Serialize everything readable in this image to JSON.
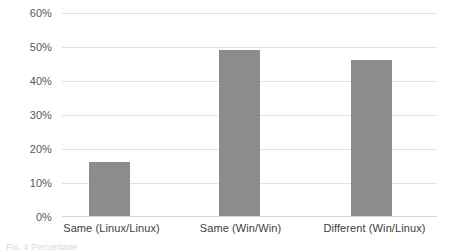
{
  "chart_data": {
    "type": "bar",
    "title": "",
    "subtitle": "",
    "xlabel": "",
    "ylabel": "",
    "categories": [
      "Same (Linux/Linux)",
      "Same (Win/Win)",
      "Different (Win/Linux)"
    ],
    "values": [
      16,
      49,
      46
    ],
    "value_labels": [
      "16%",
      "49%",
      "46%"
    ],
    "ylim": [
      0,
      60
    ],
    "ytick_values": [
      0,
      10,
      20,
      30,
      40,
      50,
      60
    ],
    "ytick_labels": [
      "0%",
      "10%",
      "20%",
      "30%",
      "40%",
      "50%",
      "60%"
    ],
    "grid": true,
    "legend": false,
    "legend_position": "none",
    "series": [
      {
        "name": "",
        "color": "#8c8c8c",
        "values": [
          16,
          49,
          46
        ]
      }
    ]
  },
  "style": {
    "bar_color": "#8c8c8c",
    "gridline_color": "#e2e2e2",
    "baseline_color": "#d6d6d6",
    "tick_label_color": "#595959",
    "category_label_color": "#404040",
    "background": "#ffffff"
  },
  "caption": {
    "text": "Fig. 4 Percentage"
  }
}
